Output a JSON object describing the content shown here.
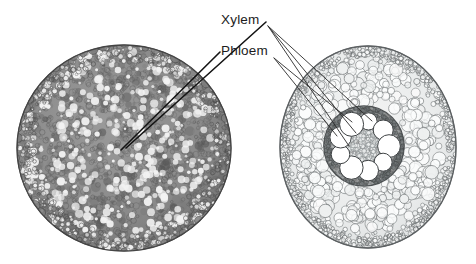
{
  "figure": {
    "background_color": "#ffffff",
    "width": 476,
    "height": 264
  },
  "labels": [
    {
      "id": "xylem",
      "text": "Xylem",
      "x": 221,
      "y": 24,
      "color": "#1c1c1c"
    },
    {
      "id": "phloem",
      "text": "Phloem",
      "x": 221,
      "y": 55,
      "color": "#1c1c1c"
    }
  ],
  "specimens": [
    {
      "id": "left-specimen",
      "name": "dark-root-cross-section",
      "center_x": 124,
      "center_y": 148,
      "radius_x": 107,
      "radius_y": 103,
      "tone": "dark",
      "fill_color": "#8d8d8d",
      "edge_color": "#4a4a4a",
      "cell_color": "#f2f2f2",
      "cell_count": 1450,
      "stele_x": 122,
      "stele_y": 147
    },
    {
      "id": "right-specimen",
      "name": "light-root-cross-section",
      "center_x": 368,
      "center_y": 147,
      "radius_x": 88,
      "radius_y": 101,
      "tone": "light",
      "fill_color": "#eceeee",
      "edge_color": "#5d6163",
      "cell_color": "#ffffff",
      "cortex_cell_count": 520,
      "stele": {
        "center_x": 364,
        "center_y": 146,
        "radius": 40,
        "ring_color": "#5a5e60",
        "pith_color": "#d8dbdb",
        "vessel_color": "#ffffff",
        "vessel_count": 9,
        "vessel_radius": 10.5,
        "vessel_ring_radius": 25
      }
    }
  ],
  "leader_lines": [
    {
      "from": "xylem",
      "to": "left-specimen-stele",
      "x1": 266,
      "y1": 22,
      "x2": 126,
      "y2": 148
    },
    {
      "from": "phloem",
      "to": "left-specimen-stele",
      "x1": 220,
      "y1": 52,
      "x2": 121,
      "y2": 150
    },
    {
      "from": "xylem",
      "to": "right-specimen-vessel-top",
      "x1": 268,
      "y1": 26,
      "x2": 372,
      "y2": 121
    },
    {
      "from": "xylem",
      "to": "right-specimen-vessel-mid",
      "x1": 268,
      "y1": 26,
      "x2": 356,
      "y2": 133
    },
    {
      "from": "xylem",
      "to": "right-specimen-vessel-low",
      "x1": 268,
      "y1": 26,
      "x2": 349,
      "y2": 146
    },
    {
      "from": "phloem",
      "to": "right-specimen-ring-upper",
      "x1": 274,
      "y1": 58,
      "x2": 352,
      "y2": 122
    },
    {
      "from": "phloem",
      "to": "right-specimen-ring-left",
      "x1": 274,
      "y1": 58,
      "x2": 337,
      "y2": 136
    }
  ]
}
